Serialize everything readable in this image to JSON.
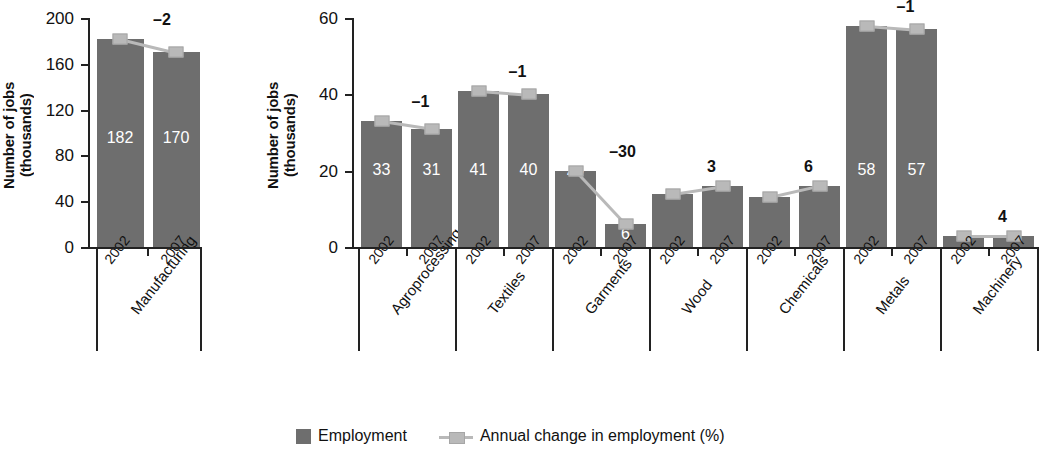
{
  "chart_data": {
    "type": "bar",
    "title": "",
    "ylabel": "Number of jobs\n(thousands)",
    "xlabel": "",
    "grid": false,
    "legend_position": "bottom-center",
    "legend": [
      {
        "key": "employment",
        "label": "Employment",
        "color": "#6e6e6e",
        "marker": "square"
      },
      {
        "key": "annual_change",
        "label": "Annual change in employment (%)",
        "color": "#b9b9b9",
        "marker": "line-square"
      }
    ],
    "panels": [
      {
        "name": "total",
        "ylabel": "Number of jobs\n(thousands)",
        "ylim": [
          0,
          200
        ],
        "yticks": [
          0,
          40,
          80,
          120,
          160,
          200
        ],
        "ytick_labels": [
          "0",
          "40",
          "80",
          "120",
          "160",
          "200"
        ],
        "categories": [
          {
            "label": "Manufacturing",
            "years": [
              "2002",
              "2007"
            ],
            "values": [
              182,
              170
            ],
            "value_labels": [
              "182",
              "170"
            ],
            "annual_change": -2,
            "annual_change_label": "–2"
          }
        ]
      },
      {
        "name": "subsectors",
        "ylabel": "Number of jobs\n(thousands)",
        "ylim": [
          0,
          60
        ],
        "yticks": [
          0,
          20,
          40,
          60
        ],
        "ytick_labels": [
          "0",
          "20",
          "40",
          "60"
        ],
        "categories": [
          {
            "label": "Agroprocessing",
            "years": [
              "2002",
              "2007"
            ],
            "values": [
              33,
              31
            ],
            "value_labels": [
              "33",
              "31"
            ],
            "annual_change": -1,
            "annual_change_label": "–1"
          },
          {
            "label": "Textiles",
            "years": [
              "2002",
              "2007"
            ],
            "values": [
              41,
              40
            ],
            "value_labels": [
              "41",
              "40"
            ],
            "annual_change": -1,
            "annual_change_label": "–1"
          },
          {
            "label": "Garments",
            "years": [
              "2002",
              "2007"
            ],
            "values": [
              20,
              6
            ],
            "value_labels": [
              "20",
              "6"
            ],
            "annual_change": -30,
            "annual_change_label": "–30"
          },
          {
            "label": "Wood",
            "years": [
              "2002",
              "2007"
            ],
            "values": [
              14,
              16
            ],
            "value_labels": [
              "14",
              "16"
            ],
            "annual_change": 3,
            "annual_change_label": "3"
          },
          {
            "label": "Chemicals",
            "years": [
              "2002",
              "2007"
            ],
            "values": [
              13,
              16
            ],
            "value_labels": [
              "13",
              "16"
            ],
            "annual_change": 6,
            "annual_change_label": "6"
          },
          {
            "label": "Metals",
            "years": [
              "2002",
              "2007"
            ],
            "values": [
              58,
              57
            ],
            "value_labels": [
              "58",
              "57"
            ],
            "annual_change": -1,
            "annual_change_label": "–1"
          },
          {
            "label": "Machinery",
            "years": [
              "2002",
              "2007"
            ],
            "values": [
              3,
              3
            ],
            "value_labels": [
              "",
              ""
            ],
            "annual_change": 4,
            "annual_change_label": "4"
          }
        ]
      }
    ],
    "colors": {
      "bar": "#6e6e6e",
      "marker": "#b9b9b9",
      "axis": "#222222",
      "value_text": "#ffffff",
      "background": "#ffffff"
    }
  }
}
